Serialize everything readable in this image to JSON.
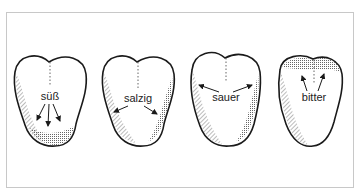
{
  "figure": {
    "background": "#ffffff",
    "frame_color": "#c8c8c8",
    "ink_color": "#1a1a1a",
    "tongues": [
      {
        "id": "sweet",
        "label": "süß",
        "region": "tip"
      },
      {
        "id": "salty",
        "label": "salzig",
        "region": "sides-front"
      },
      {
        "id": "sour",
        "label": "sauer",
        "region": "sides"
      },
      {
        "id": "bitter",
        "label": "bitter",
        "region": "back"
      }
    ]
  }
}
